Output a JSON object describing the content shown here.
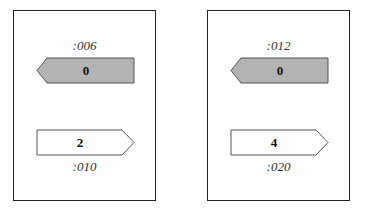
{
  "colors": {
    "border": "#222222",
    "filled_arrow": "#b3b3b3",
    "empty_arrow": "#ffffff"
  },
  "panels": [
    {
      "top_address": ":006",
      "left_arrow_value": "0",
      "right_arrow_value": "2",
      "bottom_address": ":010"
    },
    {
      "top_address": ":012",
      "left_arrow_value": "0",
      "right_arrow_value": "4",
      "bottom_address": ":020"
    }
  ]
}
